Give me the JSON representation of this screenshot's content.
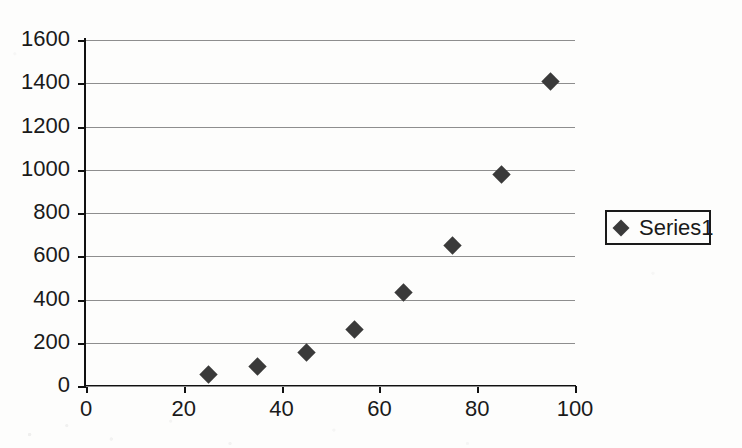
{
  "chart_data": {
    "type": "scatter",
    "title": "",
    "subtitle": "",
    "xlabel": "",
    "ylabel": "",
    "xlim": [
      0,
      100
    ],
    "ylim": [
      0,
      1600
    ],
    "xticks": [
      0,
      20,
      40,
      60,
      80,
      100
    ],
    "yticks": [
      0,
      200,
      400,
      600,
      800,
      1000,
      1200,
      1400,
      1600
    ],
    "grid": "horizontal",
    "legend_position": "right",
    "marker": "diamond",
    "marker_color": "#3a3a3a",
    "axis_color": "#111111",
    "gridline_color": "#8e8e8e",
    "background_color": "#fdfdfc",
    "series": [
      {
        "name": "Series1",
        "x": [
          25,
          35,
          45,
          55,
          65,
          75,
          85,
          95
        ],
        "y": [
          55,
          90,
          155,
          262,
          432,
          648,
          978,
          1408
        ],
        "points": [
          {
            "x": 25,
            "y": 55
          },
          {
            "x": 35,
            "y": 90
          },
          {
            "x": 45,
            "y": 155
          },
          {
            "x": 55,
            "y": 262
          },
          {
            "x": 65,
            "y": 432
          },
          {
            "x": 75,
            "y": 648
          },
          {
            "x": 85,
            "y": 978
          },
          {
            "x": 95,
            "y": 1408
          }
        ]
      }
    ]
  },
  "legend": {
    "entries": [
      {
        "label": "Series1",
        "marker_icon": "diamond-marker-icon"
      }
    ]
  }
}
